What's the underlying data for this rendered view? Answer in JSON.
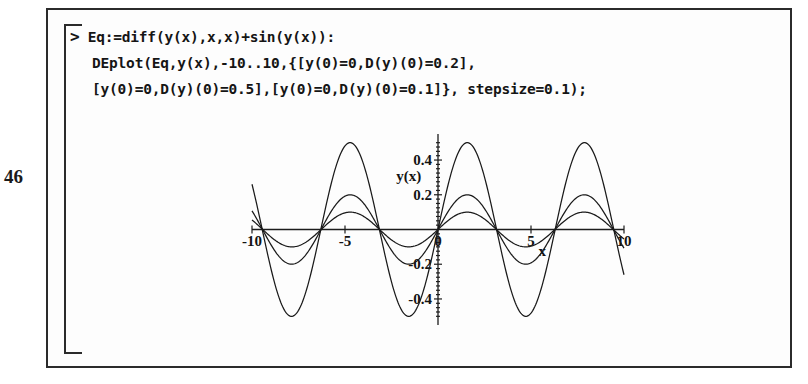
{
  "page": {
    "page_number": "46"
  },
  "worksheet": {
    "prompt": ">",
    "code_lines": [
      "Eq:=diff(y(x),x,x)+sin(y(x)):",
      "DEplot(Eq,y(x),-10..10,{[y(0)=0,D(y)(0)=0.2],",
      "[y(0)=0,D(y)(0)=0.5],[y(0)=0,D(y)(0)=0.1]}, stepsize=0.1);"
    ]
  },
  "chart_data": {
    "type": "line",
    "title": "",
    "xlabel": "x",
    "ylabel": "y(x)",
    "xlim": [
      -10,
      10
    ],
    "ylim": [
      -0.55,
      0.55
    ],
    "grid": false,
    "legend": "none",
    "xticks": [
      -10,
      -5,
      0,
      5,
      10
    ],
    "xtick_labels": [
      "-10",
      "-5",
      "0",
      "5",
      "10"
    ],
    "yticks": [
      -0.4,
      -0.2,
      0.2,
      0.4
    ],
    "ytick_labels": [
      "-0.4",
      "-0.2",
      "0.2",
      "0.4"
    ],
    "equation": "y''(x) + sin(y(x)) = 0",
    "stepsize": 0.1,
    "series": [
      {
        "name": "y(0)=0, D(y)(0)=0.5",
        "amplitude": 0.5,
        "period": 6.3,
        "phase": 0,
        "initial_velocity": 0.5
      },
      {
        "name": "y(0)=0, D(y)(0)=0.2",
        "amplitude": 0.2,
        "period": 6.29,
        "phase": 0,
        "initial_velocity": 0.2
      },
      {
        "name": "y(0)=0, D(y)(0)=0.1",
        "amplitude": 0.1,
        "period": 6.283,
        "phase": 0,
        "initial_velocity": 0.1
      }
    ],
    "axis_name_positions": {
      "ylabel_at": [
        -0.9,
        0.28
      ],
      "xlabel_at": [
        5.6,
        -0.07
      ]
    }
  }
}
